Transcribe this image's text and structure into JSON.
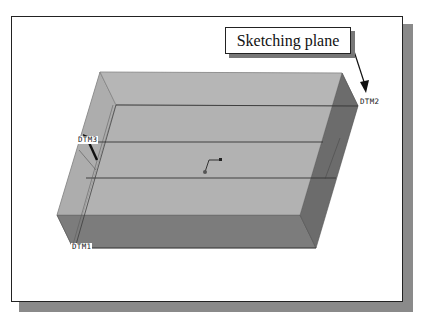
{
  "figure": {
    "callout_label": "Sketching plane",
    "datum_labels": {
      "dtm1": "DTM1",
      "dtm2": "DTM2",
      "dtm3": "DTM3"
    },
    "colors": {
      "top_face": "#b4b4b4",
      "left_face": "#a6a6a6",
      "front_face": "#7a7a7a",
      "right_face": "#6a6a6a",
      "edge": "#333333",
      "frame_shadow": "#8a8a8a"
    }
  }
}
